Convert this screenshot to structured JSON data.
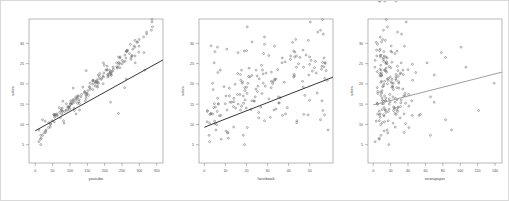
{
  "figure": {
    "background": "#ffffff",
    "border_color": "#d9d9d9",
    "panel_count": 3,
    "frame_color": "#8a8a8a",
    "point_color": "#6e6e6e",
    "line_color_dark": "#2b2b2b",
    "line_color_light": "#9a9a9a"
  },
  "chart_data": [
    {
      "type": "scatter",
      "title": "",
      "xlabel": "youtube",
      "ylabel": "sales",
      "xlim": [
        -18,
        368
      ],
      "ylim": [
        0.5,
        36
      ],
      "xticks": [
        0,
        50,
        100,
        150,
        200,
        250,
        300,
        350
      ],
      "yticks": [
        5,
        10,
        15,
        20,
        25,
        30
      ],
      "grid": false,
      "legend": null,
      "fit_line": {
        "type": "linear",
        "intercept": 8.44,
        "slope": 0.0475,
        "color": "#2b2b2b"
      },
      "x": [
        276.12,
        53.4,
        20.64,
        181.8,
        216.96,
        10.44,
        69,
        144.24,
        10.32,
        239.76,
        79.32,
        257.64,
        28.56,
        117,
        244.92,
        234.48,
        81.36,
        337.68,
        83.04,
        176.76,
        262.08,
        284.88,
        15.84,
        273.96,
        74.76,
        315.48,
        146.64,
        127.32,
        117.84,
        121.56,
        313.08,
        72.48,
        320.76,
        196.44,
        207.24,
        203.28,
        122.04,
        243.84,
        136.92,
        199.08,
        31.56,
        336.12,
        102.24,
        57.6,
        262.08,
        63.72,
        89.4,
        109.56,
        155.16,
        236.04,
        176.64,
        38.88,
        77.64,
        54.12,
        287.52,
        14.52,
        158.76,
        287.88,
        262.68,
        55.68,
        320.76,
        239.88,
        15.72,
        166.2,
        258.12,
        146.64,
        93.96,
        186.12,
        208.92,
        61.32,
        264.12,
        158.4,
        206.88,
        166.08,
        54.6,
        153.24,
        126.12,
        101.88,
        243.84,
        117,
        157.32,
        293.04,
        148.56,
        56.4,
        112.92,
        99.12,
        299.04,
        98.88,
        172.44,
        48.36,
        127.32,
        182.28,
        219.12,
        43.2,
        177.84,
        334.56,
        172.68,
        197.64,
        258.24,
        210.96,
        146.64,
        196.56,
        287.4,
        243.12,
        38.28,
        298.08,
        120.84,
        165.48,
        261.24,
        147.12,
        112.68,
        218.28,
        93.12,
        131.76,
        29.88,
        180.72,
        94.56,
        336.24,
        102.6,
        276.12,
        97.44,
        218.4,
        206.64,
        278.52,
        266.04,
        25.44,
        111.6,
        195.6,
        101.52,
        299.52,
        89.4,
        84.84,
        239.76,
        225.12,
        44.52,
        96.84,
        152.16,
        235.08,
        75.96,
        149.28,
        166.2,
        271.2,
        175.32,
        250.08,
        166.2,
        21.12,
        106.68,
        179.4,
        278.76,
        237.72,
        214.2,
        79.32,
        121.08,
        29.4,
        106.08,
        216.36,
        179.16,
        43.44,
        108.48,
        142.08,
        254.4,
        108.12,
        195.24,
        133.2,
        215.4,
        70.2,
        210,
        215.04,
        250.44,
        172.92,
        264.36,
        124.8,
        74.76,
        17.28,
        189.84,
        113.28,
        222.36,
        56.16,
        312.12,
        190.8,
        241.08,
        224.64,
        280.92,
        182.4,
        184.56,
        62.4,
        286.92,
        141.96,
        294.48,
        143.52,
        77.76,
        126.12,
        220.32,
        208.56
      ],
      "y": [
        26.52,
        12.48,
        11.16,
        22.2,
        15.48,
        8.64,
        14.16,
        15.84,
        5.76,
        12.72,
        15.72,
        19.08,
        10.8,
        16.8,
        26.64,
        25.2,
        10.92,
        34.08,
        10.32,
        20.88,
        21.24,
        29.4,
        5.04,
        29.76,
        13.68,
        23.4,
        23.28,
        13.56,
        12.6,
        15.24,
        27.72,
        11.64,
        32.76,
        25.2,
        24.36,
        23.4,
        17.04,
        24,
        19.2,
        24.6,
        8.64,
        35.28,
        15.84,
        12.48,
        27.96,
        12.24,
        15.12,
        18.96,
        19.32,
        23.88,
        20.64,
        10.44,
        14.04,
        12.36,
        26.88,
        6.36,
        18.72,
        25.2,
        28.2,
        11.76,
        32.28,
        26.64,
        7.32,
        20.88,
        27.12,
        16.44,
        14.28,
        22.56,
        21.72,
        12.24,
        28.08,
        20.16,
        23.52,
        18.6,
        10.68,
        17.16,
        15.6,
        15,
        26.4,
        15.96,
        19.08,
        30.24,
        17.64,
        12.12,
        13.44,
        14.52,
        29.28,
        13.8,
        20.52,
        10.92,
        15.12,
        20.16,
        22.08,
        9.36,
        20.16,
        33.24,
        19.44,
        22.68,
        25.56,
        21.96,
        17.04,
        21.72,
        30.72,
        25.08,
        9.24,
        27.84,
        16.44,
        19.92,
        26.4,
        17.4,
        15.48,
        22.44,
        13.56,
        16.8,
        8.04,
        20.4,
        14.4,
        35.88,
        15,
        26.04,
        14.28,
        22.32,
        23.4,
        26.88,
        28.32,
        7.92,
        14.04,
        20.04,
        15.24,
        30.96,
        13.56,
        13.2,
        25.32,
        23.64,
        10.2,
        14.16,
        18.36,
        24.24,
        12.6,
        17.64,
        20.64,
        27.48,
        20.52,
        24.96,
        20.88,
        7.32,
        15.12,
        19.2,
        27,
        24.12,
        23.4,
        13.2,
        16.56,
        8.4,
        15.36,
        22.92,
        19.44,
        9.96,
        16.08,
        17.76,
        25.44,
        15.84,
        21.96,
        17.4,
        22.68,
        12.96,
        22.32,
        22.8,
        25.8,
        20.16,
        28.08,
        17.04,
        13.44,
        6.6,
        21.12,
        16.32,
        23.16,
        12.36,
        31.56,
        21.36,
        24.84,
        24.12,
        28.56,
        21.24,
        21.84,
        12.6,
        29.04,
        18.12,
        30.36,
        18,
        13.32,
        16.08,
        23.04,
        22.32
      ]
    },
    {
      "type": "scatter",
      "title": "",
      "xlabel": "facebook",
      "ylabel": "sales",
      "xlim": [
        -2.5,
        61
      ],
      "ylim": [
        0.5,
        36
      ],
      "xticks": [
        0,
        10,
        20,
        30,
        40,
        50
      ],
      "yticks": [
        5,
        10,
        15,
        20,
        25,
        30
      ],
      "grid": false,
      "legend": null,
      "fit_line": {
        "type": "linear",
        "intercept": 9.31,
        "slope": 0.2025,
        "color": "#2b2b2b"
      },
      "x": [
        45.36,
        47.16,
        55.08,
        49.56,
        12.96,
        58.68,
        39.36,
        23.52,
        2.52,
        3.12,
        23.76,
        31.68,
        4.92,
        35.16,
        49.92,
        57.24,
        43.92,
        20.4,
        2.52,
        33.36,
        26.04,
        3.24,
        19.08,
        28.56,
        22.08,
        24.6,
        57.72,
        33,
        38.52,
        35.4,
        15.96,
        25.8,
        53.76,
        4.68,
        55.68,
        7.56,
        11.88,
        52.2,
        46.92,
        27.12,
        5.52,
        50.28,
        55.8,
        2.64,
        5.04,
        7.8,
        4.8,
        11.88,
        9.36,
        21.24,
        46.56,
        43.8,
        19.92,
        57,
        43.68,
        8.04,
        24.48,
        36.84,
        20.04,
        31.32,
        56.4,
        42.84,
        2.28,
        58.32,
        48.24,
        6.36,
        26.76,
        15.84,
        42.36,
        37.08,
        42.36,
        3.96,
        34.8,
        4.2,
        1.32,
        47.64,
        14.04,
        6.6,
        36.96,
        49.92,
        19.2,
        41.88,
        27.36,
        7.2,
        1.56,
        17.64,
        33.24,
        33.96,
        18.12,
        28.56,
        6.72,
        18,
        22.56,
        13.92,
        20.64,
        55.08,
        28.92,
        29.28,
        52.68,
        25.08,
        18.48,
        21.6,
        49.32,
        57.24,
        20.4,
        42.96,
        14.04,
        14.64,
        56.76,
        15.72,
        12.24,
        27.84,
        10.8,
        24.12,
        11.16,
        37.92,
        13.8,
        56.04,
        16.08,
        40.8,
        5.28,
        42.6,
        27.6,
        40.92,
        46.8,
        11.04,
        14.88,
        32.4,
        18.6,
        43.32,
        17.16,
        1.44,
        56.04,
        55.56,
        5.04,
        4.44,
        19.2,
        56.64,
        3.12,
        20.28,
        31.8,
        28.08,
        32.52,
        44.64,
        17.28,
        18.48,
        9.96,
        20.04,
        30.6,
        43.68,
        17.64,
        6.12,
        36,
        10.32,
        35.4,
        31.8,
        25.44,
        5.88,
        19.32,
        53.52,
        38.28,
        22.56,
        42.72,
        16.92,
        53.04,
        25.8,
        17.16,
        6.48,
        50.64,
        27.96,
        18.96,
        10.32,
        56.16,
        11.4,
        33.36,
        30.6,
        51.24,
        49.2,
        28.56,
        57.12,
        49.92,
        47.04,
        10.68,
        33.96,
        21,
        3.96,
        6.24,
        25.2,
        22.68
      ],
      "y": [
        26.52,
        12.48,
        11.16,
        22.2,
        15.48,
        8.64,
        14.16,
        15.84,
        5.76,
        12.72,
        15.72,
        19.08,
        10.8,
        16.8,
        26.64,
        25.2,
        10.92,
        34.08,
        10.32,
        20.88,
        21.24,
        29.4,
        5.04,
        29.76,
        13.68,
        23.4,
        23.28,
        13.56,
        12.6,
        15.24,
        27.72,
        11.64,
        32.76,
        25.2,
        24.36,
        23.4,
        17.04,
        24,
        19.2,
        24.6,
        8.64,
        35.28,
        15.84,
        12.48,
        27.96,
        12.24,
        15.12,
        18.96,
        19.32,
        23.88,
        20.64,
        10.44,
        14.04,
        12.36,
        26.88,
        6.36,
        18.72,
        25.2,
        28.2,
        11.76,
        32.28,
        26.64,
        7.32,
        20.88,
        27.12,
        16.44,
        14.28,
        22.56,
        21.72,
        12.24,
        28.08,
        20.16,
        23.52,
        18.6,
        10.68,
        17.16,
        15.6,
        15,
        26.4,
        15.96,
        19.08,
        30.24,
        17.64,
        12.12,
        13.44,
        14.52,
        29.28,
        13.8,
        20.52,
        10.92,
        15.12,
        20.16,
        22.08,
        9.36,
        20.16,
        33.24,
        19.44,
        22.68,
        25.56,
        21.96,
        17.04,
        21.72,
        30.72,
        25.08,
        9.24,
        27.84,
        16.44,
        19.92,
        26.4,
        17.4,
        15.48,
        22.44,
        13.56,
        16.8,
        8.04,
        20.4,
        14.4,
        35.88,
        15,
        26.04,
        14.28,
        22.32,
        23.4,
        26.88,
        28.32,
        7.92,
        14.04,
        20.04,
        15.24,
        30.96,
        13.56,
        13.2,
        25.32,
        23.64,
        10.2,
        14.16,
        18.36,
        24.24,
        12.6,
        17.64,
        20.64,
        27.48,
        20.52,
        24.96,
        20.88,
        7.32,
        15.12,
        19.2,
        27,
        24.12,
        23.4,
        13.2,
        16.56,
        8.4,
        15.36,
        22.92,
        19.44,
        9.96,
        16.08,
        17.76,
        25.44,
        15.84,
        21.96,
        17.4,
        22.68,
        12.96,
        22.32,
        22.8,
        25.8,
        20.16,
        28.08,
        17.04,
        13.44,
        6.6,
        21.12,
        16.32,
        23.16,
        12.36,
        31.56,
        21.36,
        24.84,
        24.12,
        28.56,
        21.24,
        21.84,
        12.6,
        29.04,
        18.12,
        30.36,
        18,
        13.32,
        16.08,
        23.04,
        22.32
      ]
    },
    {
      "type": "scatter",
      "title": "",
      "xlabel": "newspaper",
      "ylabel": "sales",
      "xlim": [
        -6,
        148
      ],
      "ylim": [
        0.5,
        36
      ],
      "xticks": [
        0,
        20,
        40,
        60,
        80,
        100,
        120,
        140
      ],
      "yticks": [
        5,
        10,
        15,
        20,
        25,
        30
      ],
      "grid": false,
      "legend": null,
      "fit_line": {
        "type": "linear",
        "intercept": 14.82,
        "slope": 0.0546,
        "color": "#9a9a9a"
      },
      "x": [
        83.04,
        54.12,
        83.16,
        70.2,
        70.08,
        90,
        28.2,
        13.92,
        2.16,
        25.08,
        11.64,
        4.68,
        3.48,
        65.88,
        8.4,
        32.16,
        6.96,
        16.32,
        22.92,
        17.16,
        25.92,
        20.64,
        17.88,
        4.92,
        10.32,
        34.08,
        28.44,
        27.36,
        35.4,
        37.2,
        78.36,
        30.96,
        27.96,
        61.92,
        27.84,
        13.08,
        36.36,
        20.16,
        22.56,
        8.64,
        16.08,
        37.92,
        44.28,
        26.28,
        12.24,
        44.76,
        10.32,
        29.52,
        10.68,
        14.88,
        9.6,
        10.44,
        24.36,
        12,
        4.08,
        6.84,
        33.96,
        15,
        7.2,
        8.16,
        32.52,
        14.52,
        65.76,
        45.24,
        8.76,
        25.32,
        23.4,
        7.32,
        19.68,
        52.68,
        20.28,
        29.4,
        39.96,
        23.16,
        13.08,
        8.64,
        19.32,
        5.04,
        15.96,
        10.56,
        27.12,
        3.48,
        5.28,
        12.6,
        23.4,
        40.92,
        35.88,
        18.36,
        20.4,
        17.16,
        11.76,
        21.6,
        9.6,
        25.32,
        23.16,
        11.76,
        22.32,
        9.24,
        12.24,
        7.68,
        13.08,
        26.04,
        13.92,
        14.4,
        41.04,
        21.48,
        14.52,
        12.12,
        11.76,
        40.68,
        25.32,
        30.6,
        13.68,
        22.56,
        35.64,
        8.76,
        31.32,
        15,
        18.48,
        11.52,
        28.68,
        26.28,
        9.12,
        12.6,
        3.84,
        16.68,
        25.08,
        16.32,
        4.68,
        10.8,
        14.04,
        28.08,
        21.36,
        7.68,
        37.2,
        12.48,
        10.08,
        18.36,
        8.04,
        36.48,
        13.08,
        24.84,
        29.28,
        15.96,
        26.52,
        8.88,
        4.8,
        21.24,
        8.16,
        1.92,
        13.44,
        17.28,
        10.2,
        12.6,
        31.68,
        15.36,
        11.76,
        8.52,
        27.24,
        9.72,
        15.36,
        14.4,
        9.24,
        19.08,
        31.68,
        14.64,
        34.56,
        48.84,
        2.16,
        138.96,
        27.24,
        35.16,
        121.08,
        6.96,
        21.72,
        18.48,
        14.4,
        7.08,
        8.04,
        17.64,
        45.12,
        106.56,
        7.92,
        16.2,
        28.44,
        5.04,
        100.92,
        5.16,
        9.48,
        8.4,
        6.96,
        32.28,
        4.56,
        9.48,
        13.32,
        6.84,
        26.16,
        8.16
      ],
      "y": [
        26.52,
        12.48,
        11.16,
        22.2,
        15.48,
        8.64,
        14.16,
        15.84,
        5.76,
        12.72,
        15.72,
        19.08,
        10.8,
        16.8,
        26.64,
        25.2,
        10.92,
        34.08,
        10.32,
        20.88,
        21.24,
        29.4,
        5.04,
        29.76,
        13.68,
        23.4,
        23.28,
        13.56,
        12.6,
        15.24,
        27.72,
        11.64,
        32.76,
        25.2,
        24.36,
        23.4,
        17.04,
        24,
        19.2,
        24.6,
        8.64,
        35.28,
        15.84,
        12.48,
        27.96,
        12.24,
        15.12,
        18.96,
        19.32,
        23.88,
        20.64,
        10.44,
        14.04,
        12.36,
        26.88,
        6.36,
        18.72,
        25.2,
        28.2,
        11.76,
        32.28,
        26.64,
        7.32,
        20.88,
        27.12,
        16.44,
        14.28,
        22.56,
        21.72,
        12.24,
        28.08,
        20.16,
        23.52,
        18.6,
        10.68,
        17.16,
        15.6,
        15,
        26.4,
        15.96,
        19.08,
        30.24,
        17.64,
        12.12,
        13.44,
        14.52,
        29.28,
        13.8,
        20.52,
        10.92,
        15.12,
        20.16,
        22.08,
        9.36,
        20.16,
        33.24,
        19.44,
        22.68,
        25.56,
        21.96,
        17.04,
        21.72,
        30.72,
        25.08,
        9.24,
        27.84,
        16.44,
        19.92,
        26.4,
        17.4,
        15.48,
        22.44,
        13.56,
        16.8,
        8.04,
        20.4,
        14.4,
        35.88,
        15,
        26.04,
        14.28,
        22.32,
        23.4,
        26.88,
        28.32,
        7.92,
        14.04,
        20.04,
        15.24,
        30.96,
        13.56,
        13.2,
        25.32,
        23.64,
        10.2,
        14.16,
        18.36,
        24.24,
        12.6,
        17.64,
        20.64,
        27.48,
        20.52,
        24.96,
        20.88,
        7.32,
        15.12,
        19.2,
        27,
        24.12,
        23.4,
        13.2,
        16.56,
        8.4,
        15.36,
        22.92,
        19.44,
        9.96,
        16.08,
        17.76,
        25.44,
        15.84,
        21.96,
        17.4,
        22.68,
        12.96,
        22.32,
        22.8,
        25.8,
        20.16,
        28.08,
        17.04,
        13.44,
        6.6,
        21.12,
        16.32,
        23.16,
        12.36,
        31.56,
        21.36,
        24.84,
        24.12,
        28.56,
        21.24,
        21.84,
        12.6,
        29.04,
        18.12,
        30.36,
        18,
        13.32,
        16.08,
        23.04,
        22.32
      ]
    }
  ]
}
